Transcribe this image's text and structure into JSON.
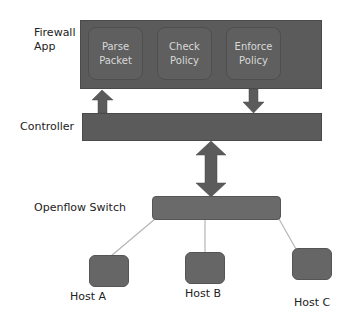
{
  "diagram": {
    "firewall_app": {
      "label_line1": "Firewall",
      "label_line2": "App",
      "modules": [
        {
          "line1": "Parse",
          "line2": "Packet"
        },
        {
          "line1": "Check",
          "line2": "Policy"
        },
        {
          "line1": "Enforce",
          "line2": "Policy"
        }
      ]
    },
    "controller": {
      "label": "Controller"
    },
    "switch": {
      "label": "Openflow Switch"
    },
    "hosts": [
      {
        "label": "Host A"
      },
      {
        "label": "Host B"
      },
      {
        "label": "Host C"
      }
    ],
    "colors": {
      "box": "#5b5b5b",
      "module_text": "#d9d9d9",
      "line": "#b5b5b5",
      "arrow": "#5b5b5b"
    }
  }
}
